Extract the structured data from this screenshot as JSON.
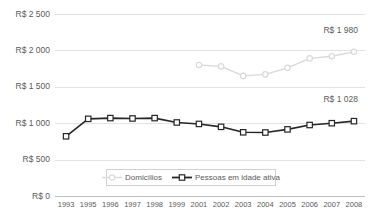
{
  "chart_data": {
    "type": "line",
    "title": "",
    "subtitle": "",
    "xlabel": "",
    "ylabel": "",
    "ylim": [
      0,
      2500
    ],
    "ytick_labels": [
      "R$ 2 500",
      "R$ 2 000",
      "R$ 1 500",
      "R$ 1 000",
      "R$ 500",
      "R$ 0"
    ],
    "ytick_values": [
      2500,
      2000,
      1500,
      1000,
      500,
      0
    ],
    "grid": true,
    "legend_position": "bottom-center",
    "categories": [
      "1993",
      "1995",
      "1996",
      "1997",
      "1998",
      "1999",
      "2001",
      "2002",
      "2003",
      "2004",
      "2005",
      "2006",
      "2007",
      "2008"
    ],
    "series": [
      {
        "name": "Domicílios",
        "color": "#d9d9d9",
        "marker": "circle-open",
        "values": [
          null,
          null,
          null,
          null,
          null,
          null,
          1800,
          1780,
          1650,
          1670,
          1760,
          1890,
          1920,
          1980
        ]
      },
      {
        "name": "Pessoas em idade ativa",
        "color": "#262626",
        "marker": "square-open",
        "values": [
          820,
          1060,
          1070,
          1065,
          1070,
          1010,
          990,
          950,
          875,
          872,
          915,
          975,
          1000,
          1028
        ]
      }
    ],
    "annotations": [
      {
        "series": "Domicílios",
        "category": "2008",
        "text": "R$ 1 980"
      },
      {
        "series": "Pessoas em idade ativa",
        "category": "2008",
        "text": "R$ 1 028"
      }
    ]
  },
  "legend": {
    "entries": [
      {
        "label": "Domicílios"
      },
      {
        "label": "Pessoas em idade ativa"
      }
    ]
  }
}
